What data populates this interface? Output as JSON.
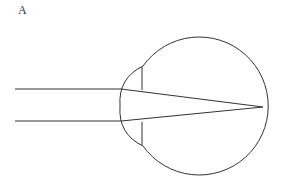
{
  "figure": {
    "panel_label": "A",
    "stroke_color": "#333333",
    "background_color": "#ffffff"
  },
  "geometry": {
    "eyeball": {
      "cx": 194,
      "cy": 106,
      "r": 69
    },
    "cornea": {
      "top": [
        143,
        66
      ],
      "apex": [
        120,
        106
      ],
      "bottom": [
        143,
        146
      ]
    },
    "iris_lines": [
      {
        "x": 142,
        "y1": 67,
        "y2": 90
      },
      {
        "x": 142,
        "y1": 122,
        "y2": 145
      }
    ],
    "incoming_rays": [
      {
        "x1": 15,
        "y1": 89,
        "x2": 121,
        "y2": 89
      },
      {
        "x1": 15,
        "y1": 121,
        "x2": 121,
        "y2": 121
      }
    ],
    "refracted_rays": [
      {
        "x1": 121,
        "y1": 89,
        "x2": 263,
        "y2": 107
      },
      {
        "x1": 121,
        "y1": 121,
        "x2": 263,
        "y2": 107
      }
    ],
    "focal_point": [
      263,
      107
    ]
  }
}
